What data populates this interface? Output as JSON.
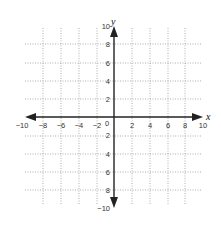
{
  "diagram": {
    "type": "coordinate-plane",
    "axes": {
      "x_label": "x",
      "y_label": "y",
      "x_range": [
        -10,
        10
      ],
      "y_range": [
        -10,
        10
      ],
      "tick_step": 2
    },
    "x_ticks": [
      "−10",
      "−8",
      "−6",
      "−4",
      "−2",
      "2",
      "4",
      "6",
      "8",
      "10"
    ],
    "y_ticks": [
      "10",
      "8",
      "6",
      "4",
      "2",
      "2",
      "4",
      "6",
      "8",
      "−10"
    ],
    "origin_label": "0",
    "grid": {
      "style": "dotted",
      "color": "#9a9a9a"
    },
    "axis_color": "#222222"
  }
}
